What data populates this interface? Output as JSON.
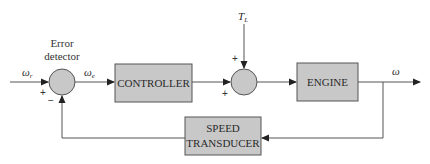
{
  "diagram": {
    "type": "closed-loop speed control block diagram",
    "colors": {
      "block_fill": "#c8c8c8",
      "block_stroke": "#555555",
      "line": "#555555",
      "text": "#2a2a2a",
      "background": "#ffffff"
    },
    "blocks": {
      "controller": {
        "label": "CONTROLLER"
      },
      "engine": {
        "label": "ENGINE"
      },
      "speed_transducer": {
        "line1": "SPEED",
        "line2": "TRANSDUCER"
      }
    },
    "summing_junctions": {
      "error_detector": {
        "label_line1": "Error",
        "label_line2": "detector",
        "input_sign": "+",
        "feedback_sign": "−"
      },
      "load_junction": {
        "top_sign": "+",
        "left_sign": "+"
      }
    },
    "signals": {
      "reference": {
        "symbol": "ω",
        "subscript": "r"
      },
      "error": {
        "symbol": "ω",
        "subscript": "e"
      },
      "load_torque": {
        "symbol": "T",
        "subscript": "L"
      },
      "output": {
        "symbol": "ω"
      }
    }
  }
}
